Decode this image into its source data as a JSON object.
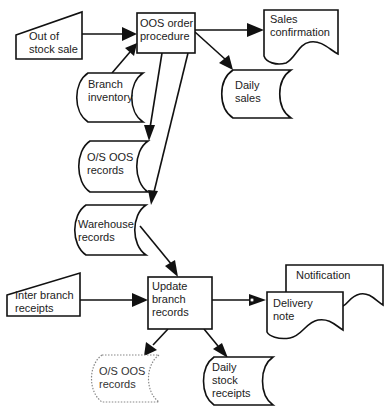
{
  "diagram": {
    "type": "flowchart",
    "nodes": {
      "out_of_stock_sale": {
        "shape": "manual-input",
        "lines": [
          "Out of",
          "stock sale"
        ]
      },
      "oos_order_procedure": {
        "shape": "process",
        "lines": [
          "OOS order",
          "procedure"
        ]
      },
      "sales_confirmation": {
        "shape": "document",
        "lines": [
          "Sales",
          "confirmation"
        ]
      },
      "daily_sales": {
        "shape": "stored-data",
        "lines": [
          "Daily",
          "sales"
        ]
      },
      "branch_inventory": {
        "shape": "stored-data",
        "lines": [
          "Branch",
          "inventory"
        ]
      },
      "os_oos_records_top": {
        "shape": "stored-data",
        "lines": [
          "O/S OOS",
          "records"
        ]
      },
      "warehouse_records": {
        "shape": "stored-data",
        "lines": [
          "Warehouse",
          "records"
        ]
      },
      "inter_branch_receipts": {
        "shape": "manual-input",
        "lines": [
          "Inter branch",
          "receipts"
        ]
      },
      "update_branch_records": {
        "shape": "process",
        "lines": [
          "Update",
          "branch",
          "records"
        ]
      },
      "notification": {
        "shape": "document",
        "lines": [
          "Notification"
        ]
      },
      "delivery_note": {
        "shape": "document",
        "lines": [
          "Delivery",
          "note"
        ]
      },
      "os_oos_records_bottom": {
        "shape": "stored-data-dotted",
        "lines": [
          "O/S OOS",
          "records"
        ]
      },
      "daily_stock_receipts": {
        "shape": "stored-data",
        "lines": [
          "Daily",
          "stock",
          "receipts"
        ]
      }
    },
    "edges": [
      {
        "from": "Out of stock sale",
        "to": "OOS order procedure"
      },
      {
        "from": "Branch inventory",
        "to": "OOS order procedure"
      },
      {
        "from": "OOS order procedure",
        "to": "Sales confirmation"
      },
      {
        "from": "OOS order procedure",
        "to": "Daily sales"
      },
      {
        "from": "OOS order procedure",
        "to": "O/S OOS records"
      },
      {
        "from": "OOS order procedure",
        "to": "Warehouse records"
      },
      {
        "from": "Warehouse records",
        "to": "Update branch records"
      },
      {
        "from": "Inter branch receipts",
        "to": "Update branch records"
      },
      {
        "from": "Update branch records",
        "to": "Delivery note / Notification"
      },
      {
        "from": "Update branch records",
        "to": "O/S OOS records (dotted)"
      },
      {
        "from": "Update branch records",
        "to": "Daily stock receipts"
      }
    ]
  }
}
